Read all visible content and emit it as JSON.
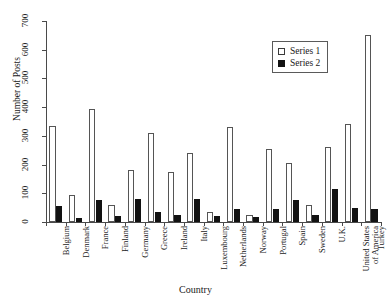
{
  "chart_data": {
    "type": "bar",
    "title": "",
    "xlabel": "Country",
    "ylabel": "Number of Posts",
    "ylim": [
      0,
      700
    ],
    "yticks": [
      0,
      100,
      200,
      300,
      400,
      500,
      600,
      700
    ],
    "grid": false,
    "legend_position": "top-right",
    "categories": [
      "Belgium",
      "Denmark",
      "France",
      "Finland",
      "Germany",
      "Greece",
      "Ireland",
      "Italy",
      "Luxembourg",
      "Netherlands",
      "Norway",
      "Portugal",
      "Spain",
      "Sweden",
      "U.K.",
      "United States of America",
      "Turkey"
    ],
    "category_lines": [
      [
        "Belgium"
      ],
      [
        "Denmark"
      ],
      [
        "France"
      ],
      [
        "Finland"
      ],
      [
        "Germany"
      ],
      [
        "Greece"
      ],
      [
        "Ireland"
      ],
      [
        "Italy"
      ],
      [
        "Luxembourg"
      ],
      [
        "Netherlands"
      ],
      [
        "Norway"
      ],
      [
        "Portugal"
      ],
      [
        "Spain"
      ],
      [
        "Sweden"
      ],
      [
        "U.K."
      ],
      [
        "United States",
        "of America"
      ],
      [
        "Turkey"
      ]
    ],
    "series": [
      {
        "name": "Series 1",
        "color": "#ffffff",
        "edge_color": "#555555",
        "values": [
          335,
          95,
          395,
          60,
          180,
          310,
          175,
          240,
          35,
          330,
          25,
          255,
          205,
          60,
          260,
          340,
          650
        ]
      },
      {
        "name": "Series 2",
        "color": "#121212",
        "edge_color": "#121212",
        "values": [
          55,
          15,
          75,
          20,
          80,
          35,
          25,
          80,
          22,
          45,
          18,
          45,
          75,
          25,
          115,
          50,
          45
        ]
      }
    ]
  },
  "legend": {
    "entries": [
      {
        "label": "Series 1",
        "swatch": "open-square"
      },
      {
        "label": "Series 2",
        "swatch": "filled-square"
      }
    ]
  }
}
